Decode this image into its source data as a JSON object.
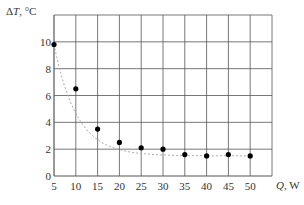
{
  "chart_data": {
    "type": "scatter",
    "title": "",
    "xlabel": "Q, W",
    "ylabel": "ΔT, °C",
    "x": [
      5,
      10,
      15,
      20,
      25,
      30,
      35,
      40,
      45,
      50
    ],
    "series": [
      {
        "name": "ΔT",
        "values": [
          9.8,
          6.5,
          3.5,
          2.5,
          2.1,
          2.0,
          1.6,
          1.5,
          1.6,
          1.5
        ],
        "marker": "filled-circle",
        "color": "#000000"
      },
      {
        "name": "fit",
        "style": "dotted-curve",
        "color": "#aaaaaa"
      }
    ],
    "xticks": [
      "5",
      "10",
      "15",
      "20",
      "25",
      "30",
      "35",
      "40",
      "45",
      "50"
    ],
    "yticks": [
      "0",
      "2",
      "4",
      "6",
      "8",
      "10"
    ],
    "xlim": [
      5,
      55
    ],
    "ylim": [
      0,
      12
    ],
    "grid": true,
    "legend": null
  },
  "axes": {
    "x_label_italic": "Q",
    "x_label_unit": ", W",
    "y_label_prefix": "Δ",
    "y_label_italic": "T",
    "y_label_unit": ", °C"
  }
}
